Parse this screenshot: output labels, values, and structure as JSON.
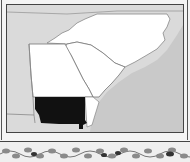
{
  "map": {
    "title": "",
    "colors": {
      "background": "#d8d8d8",
      "land": "#ffffff",
      "highlight": "#111111",
      "border": "#444444",
      "ocean": "#cfcfcf"
    },
    "regions": [
      {
        "name": "North Carolina",
        "style": "land"
      },
      {
        "name": "South Carolina",
        "style": "land"
      },
      {
        "name": "Georgia",
        "style": "land"
      },
      {
        "name": "Southern Georgia",
        "style": "highlight"
      }
    ],
    "labels": []
  },
  "decoration": {
    "type": "vine-border"
  }
}
